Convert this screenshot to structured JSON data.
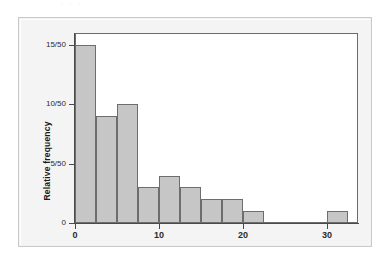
{
  "figure": {
    "kind": "histogram-figure",
    "background_color": "#f3f3f3",
    "panel_color": "#ffffff",
    "top_text_remnant": "·  ·   ·"
  },
  "chart_data": {
    "type": "bar",
    "title": "",
    "subtitle": "",
    "xlabel": "",
    "ylabel": "Relative frequency",
    "bar_color": "#c6c6c6",
    "bar_edge_color": "#6d6d6d",
    "grid": false,
    "legend": null,
    "bin_width": 2.5,
    "xlim": [
      -1.5,
      32.2
    ],
    "ylim": [
      0,
      16
    ],
    "y_tick_values": [
      0,
      5,
      10,
      15
    ],
    "y_tick_labels": [
      "0",
      "5/50",
      "10/50",
      "15/50"
    ],
    "x_tick_values": [
      0,
      10,
      20,
      30
    ],
    "x_tick_labels": [
      "0",
      "10",
      "20",
      "30"
    ],
    "bin_edges": [
      0,
      2.5,
      5,
      7.5,
      10,
      12.5,
      15,
      17.5,
      20,
      22.5,
      25,
      27.5,
      30,
      32.5
    ],
    "categories": [
      "0-2.5",
      "2.5-5",
      "5-7.5",
      "7.5-10",
      "10-12.5",
      "12.5-15",
      "15-17.5",
      "17.5-20",
      "20-22.5",
      "22.5-25",
      "25-27.5",
      "27.5-30",
      "30-32.5"
    ],
    "values": [
      15,
      9,
      10,
      3,
      4,
      3,
      2,
      2,
      1,
      0,
      0,
      0,
      1
    ],
    "relative_values": [
      "15/50",
      "9/50",
      "10/50",
      "3/50",
      "4/50",
      "3/50",
      "2/50",
      "2/50",
      "1/50",
      "0/50",
      "0/50",
      "0/50",
      "1/50"
    ],
    "total_count": 50
  }
}
